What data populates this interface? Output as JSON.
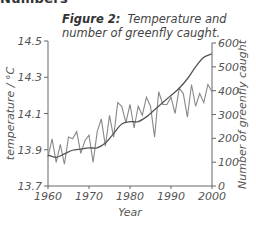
{
  "header_fragment": "Numbers",
  "figure": {
    "label": "Figure 2:",
    "caption_line1": "Temperature and",
    "caption_line2": "number of greenfly caught."
  },
  "chart_data": {
    "type": "line",
    "xlabel": "Year",
    "ylabel_left": "temperature / °C",
    "ylabel_right": "Number of greenfly caught",
    "xlim": [
      1960,
      2000
    ],
    "ylim_left": [
      13.7,
      14.5
    ],
    "ylim_right": [
      0,
      600
    ],
    "x_ticks": [
      "1960",
      "1970",
      "1980",
      "1990",
      "2000"
    ],
    "y_ticks_left": [
      "13.7",
      "13.9",
      "14.1",
      "14.3",
      "14.5"
    ],
    "y_ticks_right": [
      "0",
      "100",
      "200",
      "300",
      "400",
      "500",
      "600"
    ],
    "grid": false,
    "legend": null,
    "series": [
      {
        "name": "temperature",
        "axis": "left",
        "style": "zigzag",
        "x": [
          1960,
          1961,
          1962,
          1963,
          1964,
          1965,
          1966,
          1967,
          1968,
          1969,
          1970,
          1971,
          1972,
          1973,
          1974,
          1975,
          1976,
          1977,
          1978,
          1979,
          1980,
          1981,
          1982,
          1983,
          1984,
          1985,
          1986,
          1987,
          1988,
          1989,
          1990,
          1991,
          1992,
          1993,
          1994,
          1995,
          1996,
          1997,
          1998,
          1999,
          2000
        ],
        "values": [
          13.86,
          13.96,
          13.83,
          13.93,
          13.82,
          13.97,
          13.96,
          14.0,
          13.88,
          13.95,
          13.98,
          13.83,
          14.0,
          14.07,
          13.92,
          14.09,
          13.97,
          14.16,
          14.14,
          14.05,
          14.15,
          14.02,
          14.14,
          14.09,
          14.19,
          14.14,
          13.97,
          14.22,
          14.15,
          14.15,
          14.19,
          14.1,
          14.24,
          14.21,
          14.08,
          14.26,
          14.14,
          14.21,
          14.16,
          14.26,
          14.22
        ]
      },
      {
        "name": "greenfly caught",
        "axis": "right",
        "style": "smooth",
        "x": [
          1960,
          1962,
          1964,
          1966,
          1968,
          1970,
          1972,
          1974,
          1976,
          1978,
          1980,
          1982,
          1984,
          1986,
          1988,
          1990,
          1992,
          1994,
          1996,
          1998,
          2000
        ],
        "values": [
          130,
          120,
          135,
          150,
          155,
          160,
          160,
          180,
          220,
          260,
          270,
          270,
          290,
          320,
          350,
          380,
          410,
          450,
          500,
          540,
          555
        ]
      }
    ]
  },
  "axes": {
    "x_title": "Year",
    "left_title": "temperature / °C",
    "right_title": "Number of greenfly caught"
  }
}
